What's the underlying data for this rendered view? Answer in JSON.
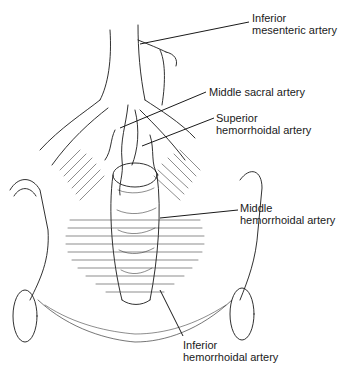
{
  "figure": {
    "labels": [
      {
        "id": "inferior-mesenteric",
        "lines": [
          "Inferior",
          "mesenteric artery"
        ],
        "x": 252,
        "y": 12
      },
      {
        "id": "middle-sacral",
        "lines": [
          "Middle sacral artery"
        ],
        "x": 209,
        "y": 86
      },
      {
        "id": "superior-hemorrhoidal",
        "lines": [
          "Superior",
          "hemorrhoidal artery"
        ],
        "x": 216,
        "y": 114
      },
      {
        "id": "middle-hemorrhoidal",
        "lines": [
          "Middle",
          "hemorrhoidal artery"
        ],
        "x": 240,
        "y": 202
      },
      {
        "id": "inferior-hemorrhoidal",
        "lines": [
          "Inferior",
          "hemorrhoidal artery"
        ],
        "x": 183,
        "y": 339
      }
    ],
    "colors": {
      "ink": "#1a1a1a",
      "background": "#ffffff"
    }
  }
}
